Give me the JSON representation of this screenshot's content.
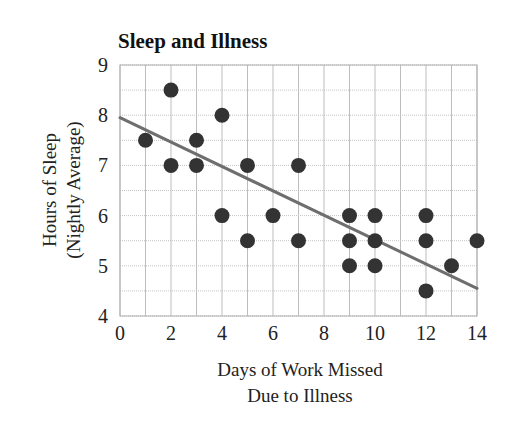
{
  "chart_data": {
    "type": "scatter",
    "title": "Sleep and Illness",
    "xlabel_line1": "Days of Work Missed",
    "xlabel_line2": "Due to Illness",
    "ylabel_line1": "Hours of Sleep",
    "ylabel_line2": "(Nightly Average)",
    "xlim": [
      0,
      14
    ],
    "ylim": [
      4,
      9
    ],
    "x_ticks": [
      0,
      2,
      4,
      6,
      8,
      10,
      12,
      14
    ],
    "y_ticks": [
      4,
      5,
      6,
      7,
      8,
      9
    ],
    "x_minor_step": 1,
    "y_minor_step": 0.5,
    "grid": true,
    "legend": null,
    "points": [
      {
        "x": 1,
        "y": 7.5
      },
      {
        "x": 2,
        "y": 8.5
      },
      {
        "x": 2,
        "y": 7
      },
      {
        "x": 3,
        "y": 7.5
      },
      {
        "x": 3,
        "y": 7
      },
      {
        "x": 4,
        "y": 8
      },
      {
        "x": 4,
        "y": 6
      },
      {
        "x": 5,
        "y": 7
      },
      {
        "x": 5,
        "y": 5.5
      },
      {
        "x": 6,
        "y": 6
      },
      {
        "x": 7,
        "y": 7
      },
      {
        "x": 7,
        "y": 5.5
      },
      {
        "x": 9,
        "y": 6
      },
      {
        "x": 9,
        "y": 5.5
      },
      {
        "x": 9,
        "y": 5
      },
      {
        "x": 10,
        "y": 6
      },
      {
        "x": 10,
        "y": 5.5
      },
      {
        "x": 10,
        "y": 5
      },
      {
        "x": 12,
        "y": 6
      },
      {
        "x": 12,
        "y": 5.5
      },
      {
        "x": 12,
        "y": 4.5
      },
      {
        "x": 13,
        "y": 5
      },
      {
        "x": 14,
        "y": 5.5
      }
    ],
    "trend_line": {
      "x1": 0,
      "y1": 7.95,
      "x2": 14,
      "y2": 4.55
    },
    "colors": {
      "points": "#333333",
      "trend_line": "#6e6e6e",
      "grid": "#bdbdbd",
      "text": "#222222"
    }
  }
}
